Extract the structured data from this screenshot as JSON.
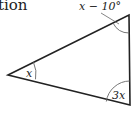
{
  "text_fragment": "tion",
  "diagram": {
    "type": "triangle",
    "vertices": {
      "left": {
        "x": 8,
        "y": 75
      },
      "top_right": {
        "x": 129,
        "y": 15
      },
      "bottom_right": {
        "x": 130,
        "y": 105
      }
    },
    "angles": {
      "left": "x",
      "top_right": "x − 10°",
      "bottom_right": "3x"
    },
    "colors": {
      "stroke": "#222222",
      "arc": "#666666"
    }
  }
}
